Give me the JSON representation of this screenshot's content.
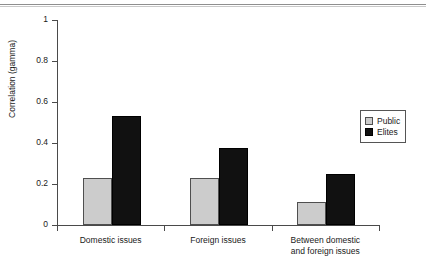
{
  "figure": {
    "top_rule": "figure-separator-rule"
  },
  "chart_data": {
    "type": "bar",
    "title": "",
    "subtitle": "",
    "xlabel": "",
    "ylabel": "Correlation (gamma)",
    "ylim": [
      0,
      1
    ],
    "ytick_labels": [
      "0",
      "0.2",
      "0.4",
      "0.6",
      "0.8",
      "1"
    ],
    "ytick_values": [
      0,
      0.2,
      0.4,
      0.6,
      0.8,
      1
    ],
    "grid": false,
    "legend_position": "right",
    "categories": [
      "Domestic issues",
      "Foreign issues",
      "Between domestic\nand foreign issues"
    ],
    "series": [
      {
        "name": "Public",
        "color": "#cccccc",
        "values": [
          0.23,
          0.23,
          0.11
        ]
      },
      {
        "name": "Elites",
        "color": "#111111",
        "values": [
          0.53,
          0.375,
          0.25
        ]
      }
    ]
  },
  "legend": {
    "items": [
      {
        "label": "Public",
        "swatch": "public-swatch"
      },
      {
        "label": "Elites",
        "swatch": "elites-swatch"
      }
    ]
  }
}
